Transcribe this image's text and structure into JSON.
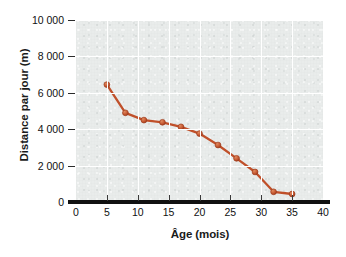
{
  "chart_data": {
    "type": "line",
    "title": "",
    "xlabel": "Âge (mois)",
    "ylabel": "Distance par jour (m)",
    "xlim": [
      0,
      40
    ],
    "ylim": [
      0,
      10000
    ],
    "grid": true,
    "legend_position": "none",
    "series_color": "#c0502a",
    "marker": "circle",
    "x": [
      5,
      8,
      11,
      14,
      17,
      20,
      23,
      26,
      29,
      32,
      35
    ],
    "values": [
      6450,
      4900,
      4500,
      4380,
      4130,
      3760,
      3130,
      2400,
      1650,
      560,
      440
    ],
    "xticks": [
      0,
      5,
      10,
      15,
      20,
      25,
      30,
      35,
      40
    ],
    "xtick_labels": [
      "0",
      "5",
      "10",
      "15",
      "20",
      "25",
      "30",
      "35",
      "40"
    ],
    "yticks": [
      0,
      2000,
      4000,
      6000,
      8000,
      10000
    ],
    "ytick_labels": [
      "0",
      "2 000",
      "4 000",
      "6 000",
      "8 000",
      "10 000"
    ]
  },
  "axes": {
    "x_title": "Âge (mois)",
    "y_title": "Distance par jour (m)"
  },
  "colors": {
    "line": "#c0502a",
    "marker_fill": "#c75a33",
    "marker_edge": "#9e3c1d",
    "plot_background": "#e9eceb",
    "grid": "#ffffff",
    "axis": "#111111",
    "text": "#111111"
  }
}
